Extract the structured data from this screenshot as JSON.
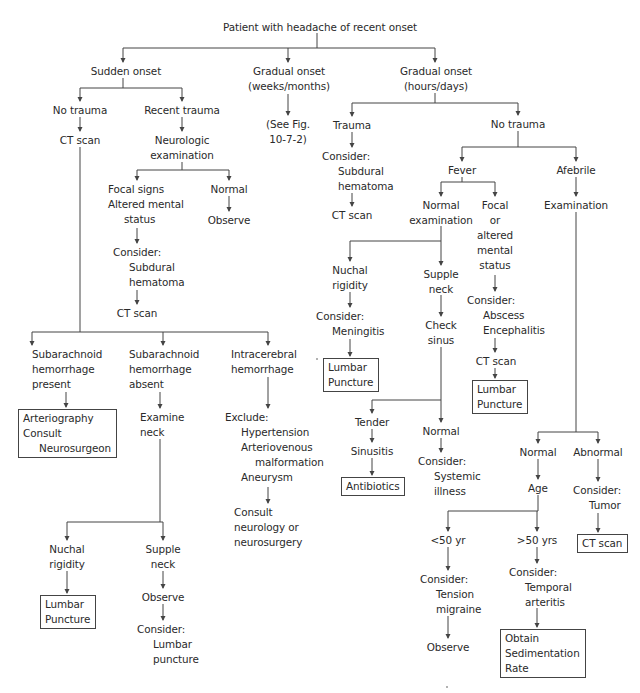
{
  "diagram": {
    "root": "Patient with headache of recent onset",
    "nodes": {
      "sudden_onset": [
        "Sudden onset"
      ],
      "gradual_weeks": [
        "Gradual onset",
        "(weeks/months)"
      ],
      "gradual_hours": [
        "Gradual onset",
        "(hours/days)"
      ],
      "no_trauma_1": [
        "No trauma"
      ],
      "ct_scan_1": [
        "CT scan"
      ],
      "recent_trauma": [
        "Recent trauma"
      ],
      "neuro_exam": [
        "Neurologic",
        "examination"
      ],
      "see_fig": [
        "(See Fig.",
        "10-7-2)"
      ],
      "focal_signs": [
        "Focal signs",
        "Altered mental",
        "status"
      ],
      "normal_1": [
        "Normal"
      ],
      "observe_1": [
        "Observe"
      ],
      "consider_subdural_1": [
        "Consider:",
        "Subdural",
        "hematoma"
      ],
      "ct_scan_2": [
        "CT scan"
      ],
      "trauma": [
        "Trauma"
      ],
      "consider_subdural_2": [
        "Consider:",
        "Subdural",
        "hematoma"
      ],
      "ct_scan_3": [
        "CT scan"
      ],
      "no_trauma_2": [
        "No trauma"
      ],
      "fever": [
        "Fever"
      ],
      "afebrile": [
        "Afebrile"
      ],
      "examination": [
        "Examination"
      ],
      "normal_exam": [
        "Normal",
        "examination"
      ],
      "focal_altered": [
        "Focal",
        "or",
        "altered",
        "mental",
        "status"
      ],
      "nuchal_rigidity_1": [
        "Nuchal",
        "rigidity"
      ],
      "supple_neck_1": [
        "Supple",
        "neck"
      ],
      "consider_meningitis": [
        "Consider:",
        "Meningitis"
      ],
      "check_sinus": [
        "Check",
        "sinus"
      ],
      "consider_abscess": [
        "Consider:",
        "Abscess",
        "Encephalitis"
      ],
      "ct_scan_4": [
        "CT scan"
      ],
      "lumbar_puncture_1": [
        "Lumbar",
        "Puncture"
      ],
      "lumbar_puncture_2": [
        "Lumbar",
        "Puncture"
      ],
      "sah_present": [
        "Subarachnoid",
        "hemorrhage",
        "present"
      ],
      "sah_absent": [
        "Subarachnoid",
        "hemorrhage",
        "absent"
      ],
      "ich": [
        "Intracerebral",
        "hemorrhage"
      ],
      "arteriography": [
        "Arteriography",
        "Consult",
        "Neurosurgeon"
      ],
      "examine_neck": [
        "Examine",
        "neck"
      ],
      "exclude": [
        "Exclude:",
        "Hypertension",
        "Arteriovenous",
        "malformation",
        "Aneurysm"
      ],
      "consult_neuro": [
        "Consult",
        "neurology or",
        "neurosurgery"
      ],
      "tender": [
        "Tender"
      ],
      "sinusitis": [
        "Sinusitis"
      ],
      "antibiotics": [
        "Antibiotics"
      ],
      "normal_2": [
        "Normal"
      ],
      "consider_systemic": [
        "Consider:",
        "Systemic",
        "illness"
      ],
      "normal_3": [
        "Normal"
      ],
      "abnormal": [
        "Abnormal"
      ],
      "age": [
        "Age"
      ],
      "consider_tumor": [
        "Consider:",
        "Tumor"
      ],
      "ct_scan_5": [
        "CT scan"
      ],
      "nuchal_rigidity_2": [
        "Nuchal",
        "rigidity"
      ],
      "supple_neck_2": [
        "Supple",
        "neck"
      ],
      "lumbar_puncture_3": [
        "Lumbar",
        "Puncture"
      ],
      "observe_2": [
        "Observe"
      ],
      "consider_lp": [
        "Consider:",
        "Lumbar",
        "puncture"
      ],
      "under_50": [
        "<50 yr"
      ],
      "over_50": [
        ">50 yrs"
      ],
      "consider_tension": [
        "Consider:",
        "Tension",
        "migraine"
      ],
      "consider_temporal": [
        "Consider:",
        "Temporal",
        "arteritis"
      ],
      "observe_3": [
        "Observe"
      ],
      "obtain_esr": [
        "Obtain",
        "Sedimentation",
        "Rate"
      ]
    }
  }
}
